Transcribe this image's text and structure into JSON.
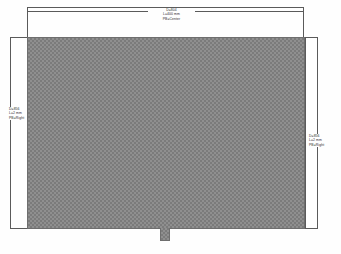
{
  "drawing": {
    "title": "Panel dimension drawing",
    "canvas": {
      "width": 341,
      "height": 254
    },
    "colors": {
      "background": "#fefefe",
      "hatch_base": "#8f8f8f",
      "hatch_mark": "#7b7b7b",
      "line": "#5a5a5a",
      "text": "#2b2b2b"
    }
  },
  "dimensions": {
    "top": {
      "name": "top-dimension",
      "diameter": "D=804",
      "length": "L=400 mm",
      "position": "PB=Center"
    },
    "left": {
      "name": "left-dimension",
      "diameter": "D=856",
      "length": "L=2 mm",
      "position": "PB=Right"
    },
    "right": {
      "name": "right-dimension",
      "diameter": "D=856",
      "length": "L=2 mm",
      "position": "PB=Right"
    }
  },
  "panel": {
    "name": "hatched-panel",
    "fill_style": "crosshatch"
  },
  "notch": {
    "name": "bottom-notch-tab",
    "fill_style": "crosshatch"
  }
}
